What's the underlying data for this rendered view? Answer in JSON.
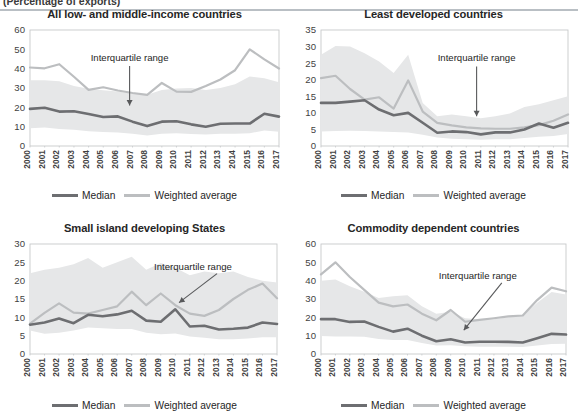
{
  "header": {
    "caption": "(Percentage of exports)",
    "rule_color": "#b9bfc4"
  },
  "legend": {
    "median_label": "Median",
    "weighted_label": "Weighted average",
    "median_color": "#6d6e71",
    "weighted_color": "#bcbec0"
  },
  "annotation": {
    "label": "Interquartile range",
    "arrow_color": "#58595b"
  },
  "style": {
    "band_color": "#e6e7e8",
    "axis_color": "#c7c9cb",
    "text_color": "#262626"
  },
  "chart_data": [
    {
      "id": "all-low-and-middle-income-countries",
      "type": "line",
      "title": "All low- and middle-income countries",
      "xlabel": "",
      "ylabel": "",
      "ylim": [
        0,
        60
      ],
      "yticks": [
        0,
        10,
        20,
        30,
        40,
        50,
        60
      ],
      "grid": false,
      "legend_position": "bottom",
      "x": [
        "2000",
        "2001",
        "2002",
        "2003",
        "2004",
        "2005",
        "2006",
        "2007",
        "2008",
        "2009",
        "2010",
        "2011",
        "2012",
        "2013",
        "2014",
        "2015",
        "2016",
        "2017"
      ],
      "series": [
        {
          "name": "Median",
          "values": [
            19.2,
            19.8,
            17.8,
            18.0,
            16.6,
            15.0,
            15.3,
            12.6,
            10.3,
            12.6,
            12.8,
            11.2,
            10.0,
            11.5,
            11.6,
            11.6,
            16.7,
            15.2
          ]
        },
        {
          "name": "Weighted average",
          "values": [
            40.6,
            40.2,
            42.3,
            35.8,
            29.0,
            30.4,
            28.7,
            27.4,
            26.4,
            32.6,
            28.1,
            28.0,
            31.0,
            34.4,
            39.2,
            50.0,
            44.8,
            40.1
          ]
        },
        {
          "name": "Interquartile range upper",
          "values": [
            34.0,
            34.0,
            33.5,
            31.0,
            29.6,
            28.9,
            28.2,
            27.0,
            26.5,
            29.0,
            29.8,
            30.0,
            29.0,
            30.0,
            32.0,
            36.0,
            35.0,
            33.0
          ]
        },
        {
          "name": "Interquartile range lower",
          "values": [
            9.2,
            9.6,
            8.8,
            8.4,
            7.6,
            7.2,
            7.0,
            6.4,
            5.4,
            6.4,
            6.6,
            6.2,
            6.0,
            6.4,
            6.4,
            6.6,
            8.0,
            7.4
          ]
        }
      ],
      "annotation": {
        "label": "Interquartile range",
        "x_frac": 0.4,
        "y_value": 44.0,
        "arrow_to_y": 21.0
      }
    },
    {
      "id": "least-developed-countries",
      "type": "line",
      "title": "Least developed countries",
      "xlabel": "",
      "ylabel": "",
      "ylim": [
        0,
        35
      ],
      "yticks": [
        0,
        5,
        10,
        15,
        20,
        25,
        30,
        35
      ],
      "grid": false,
      "legend_position": "bottom",
      "x": [
        "2000",
        "2001",
        "2002",
        "2003",
        "2004",
        "2005",
        "2006",
        "2007",
        "2008",
        "2009",
        "2010",
        "2011",
        "2012",
        "2013",
        "2014",
        "2015",
        "2016",
        "2017"
      ],
      "series": [
        {
          "name": "Median",
          "values": [
            13.0,
            13.0,
            13.4,
            13.8,
            11.0,
            9.3,
            10.0,
            7.0,
            4.0,
            4.4,
            4.2,
            3.5,
            4.1,
            4.1,
            5.0,
            6.8,
            5.5,
            7.0
          ]
        },
        {
          "name": "Weighted average",
          "values": [
            20.5,
            21.2,
            17.2,
            14.0,
            14.7,
            11.3,
            19.8,
            10.4,
            7.0,
            6.2,
            5.6,
            5.3,
            5.2,
            5.2,
            5.6,
            6.3,
            7.6,
            9.5
          ]
        },
        {
          "name": "Interquartile range upper",
          "values": [
            27.5,
            30.2,
            30.0,
            28.0,
            25.5,
            22.0,
            27.5,
            13.0,
            9.0,
            9.5,
            9.0,
            8.4,
            9.0,
            9.8,
            11.8,
            12.6,
            13.8,
            15.0
          ]
        },
        {
          "name": "Interquartile range lower",
          "values": [
            4.4,
            4.5,
            4.6,
            4.5,
            4.4,
            4.2,
            4.1,
            3.4,
            2.6,
            2.2,
            2.0,
            1.9,
            2.0,
            2.0,
            2.4,
            2.8,
            3.0,
            3.6
          ]
        }
      ],
      "annotation": {
        "label": "Interquartile range",
        "x_frac": 0.63,
        "y_value": 25.5,
        "arrow_to_y": 9.0
      }
    },
    {
      "id": "small-island-developing-states",
      "type": "line",
      "title": "Small island developing States",
      "xlabel": "",
      "ylabel": "",
      "ylim": [
        0,
        30
      ],
      "yticks": [
        0,
        5,
        10,
        15,
        20,
        25,
        30
      ],
      "grid": false,
      "legend_position": "bottom",
      "x": [
        "2000",
        "2001",
        "2002",
        "2003",
        "2004",
        "2005",
        "2006",
        "2007",
        "2008",
        "2009",
        "2010",
        "2011",
        "2012",
        "2013",
        "2014",
        "2015",
        "2016",
        "2017"
      ],
      "series": [
        {
          "name": "Median",
          "values": [
            8.0,
            8.6,
            9.7,
            8.4,
            10.7,
            10.3,
            10.8,
            11.8,
            9.1,
            8.8,
            12.2,
            7.5,
            7.7,
            6.7,
            6.9,
            7.2,
            8.6,
            8.2
          ]
        },
        {
          "name": "Weighted average",
          "values": [
            8.3,
            11.2,
            13.8,
            11.3,
            11.0,
            12.0,
            13.0,
            17.0,
            13.3,
            16.5,
            13.3,
            11.0,
            10.4,
            12.0,
            15.0,
            17.5,
            19.2,
            15.2
          ]
        },
        {
          "name": "Interquartile range upper",
          "values": [
            22.0,
            23.0,
            23.5,
            24.5,
            26.2,
            23.5,
            25.0,
            26.5,
            23.0,
            24.8,
            23.5,
            21.5,
            22.5,
            22.0,
            22.5,
            21.0,
            20.0,
            19.5
          ]
        },
        {
          "name": "Interquartile range lower",
          "values": [
            6.4,
            5.5,
            5.8,
            6.4,
            7.2,
            7.0,
            6.8,
            6.8,
            5.8,
            5.4,
            5.6,
            4.8,
            4.4,
            4.0,
            4.0,
            4.2,
            4.6,
            4.6
          ]
        }
      ],
      "annotation": {
        "label": "Interquartile range",
        "x_frac": 0.66,
        "y_value": 23.0,
        "arrow_to_y": 14.0
      }
    },
    {
      "id": "commodity-dependent-countries",
      "type": "line",
      "title": "Commodity dependent countries",
      "xlabel": "",
      "ylabel": "",
      "ylim": [
        0,
        60
      ],
      "yticks": [
        0,
        10,
        20,
        30,
        40,
        50,
        60
      ],
      "grid": false,
      "legend_position": "bottom",
      "x": [
        "2000",
        "2001",
        "2002",
        "2003",
        "2004",
        "2005",
        "2006",
        "2007",
        "2008",
        "2009",
        "2010",
        "2011",
        "2012",
        "2013",
        "2014",
        "2015",
        "2016",
        "2017"
      ],
      "series": [
        {
          "name": "Median",
          "values": [
            19.0,
            19.0,
            17.5,
            17.7,
            14.8,
            12.2,
            13.8,
            10.0,
            7.0,
            8.0,
            6.3,
            6.7,
            6.7,
            6.6,
            6.3,
            8.6,
            11.0,
            10.6
          ]
        },
        {
          "name": "Weighted average",
          "values": [
            43.4,
            50.0,
            42.0,
            35.0,
            28.0,
            26.0,
            27.0,
            22.0,
            18.4,
            24.0,
            17.6,
            18.6,
            19.5,
            20.5,
            21.0,
            29.4,
            36.2,
            34.2
          ]
        },
        {
          "name": "Interquartile range upper",
          "values": [
            40.0,
            40.6,
            37.0,
            34.0,
            30.5,
            31.5,
            32.0,
            26.0,
            22.0,
            23.0,
            19.5,
            19.0,
            19.0,
            20.0,
            21.0,
            28.0,
            33.8,
            32.5
          ]
        },
        {
          "name": "Interquartile range lower",
          "values": [
            9.8,
            9.6,
            9.5,
            9.4,
            8.2,
            7.6,
            7.6,
            6.0,
            4.6,
            4.8,
            4.2,
            4.0,
            4.0,
            4.0,
            3.8,
            4.6,
            5.4,
            5.6
          ]
        }
      ],
      "annotation": {
        "label": "Interquartile range",
        "x_frac": 0.64,
        "y_value": 41.0,
        "arrow_to_y": 13.0
      }
    }
  ]
}
